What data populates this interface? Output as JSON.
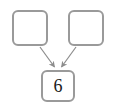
{
  "diagram": {
    "type": "flow-graph",
    "canvas": {
      "width": 114,
      "height": 106,
      "background": "#ffffff"
    },
    "style": {
      "node_border_color": "#9a9a9a",
      "node_fill_color": "#ffffff",
      "edge_color": "#8c8c8c",
      "text_color": "#1a1a1a"
    },
    "nodes": [
      {
        "id": "left",
        "label": "",
        "role": "operand-empty"
      },
      {
        "id": "right",
        "label": "",
        "role": "operand-empty"
      },
      {
        "id": "sum",
        "label": "6",
        "role": "result"
      }
    ],
    "edges": [
      {
        "from": "left",
        "to": "sum",
        "arrow": "single"
      },
      {
        "from": "right",
        "to": "sum",
        "arrow": "single"
      }
    ]
  }
}
